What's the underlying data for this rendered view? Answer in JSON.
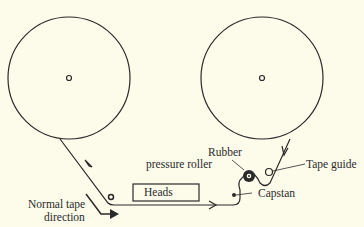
{
  "diagram": {
    "components": {
      "supply_reel": {
        "label": "",
        "cx": 69,
        "cy": 78,
        "r": 61
      },
      "takeup_reel": {
        "label": "",
        "cx": 262,
        "cy": 78,
        "r": 61
      },
      "heads": {
        "label": "Heads"
      },
      "pressure_roller": {
        "label_line1": "Rubber",
        "label_line2": "pressure roller"
      },
      "capstan": {
        "label": "Capstan"
      },
      "tape_guide": {
        "label": "Tape guide"
      },
      "direction": {
        "label_line1": "Normal tape",
        "label_line2": "direction"
      }
    },
    "colors": {
      "background": "#fdfbea",
      "ink": "#2a2a2a"
    }
  }
}
